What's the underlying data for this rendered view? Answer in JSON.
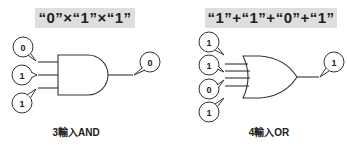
{
  "and_diagram": {
    "header": "“0”×“1”×“1”",
    "caption": "3輸入AND",
    "inputs": [
      "0",
      "1",
      "1"
    ],
    "output": "0"
  },
  "or_diagram": {
    "header": "“1”+“1”+“0”+“1”",
    "caption": "4輸入OR",
    "inputs": [
      "1",
      "1",
      "0",
      "1"
    ],
    "output": "1"
  },
  "colors": {
    "header_bg": "#dedede",
    "stroke": "#333333"
  }
}
